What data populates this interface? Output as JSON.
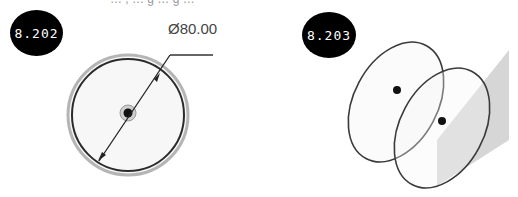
{
  "figures": [
    {
      "id": "8.202",
      "badge_label": "8.202",
      "dimension_label": "Ø80.00",
      "description": "Circle with diameter dimension and center point"
    },
    {
      "id": "8.203",
      "badge_label": "8.203",
      "description": "Two tilted ellipses (circles in 3D) with center points and a gray reference plane"
    }
  ],
  "top_cut_text": "… , … g … g …",
  "colors": {
    "badge_bg": "#000000",
    "badge_text": "#ffffff",
    "line": "#333333",
    "ring": "#aaaaaa",
    "plane": "#d9d9d9",
    "dim_text": "#444444"
  }
}
